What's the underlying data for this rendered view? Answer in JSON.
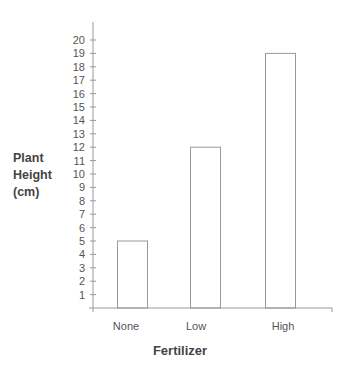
{
  "chart_data": {
    "type": "bar",
    "title": "",
    "categories": [
      "None",
      "Low",
      "High"
    ],
    "values": [
      5,
      12,
      19
    ],
    "xlabel": "Fertilizer",
    "ylabel": "Plant Height (cm)",
    "ylabel_lines": [
      "Plant",
      "Height",
      "(cm)"
    ],
    "ylim": [
      0,
      20
    ],
    "yticks": [
      1,
      2,
      3,
      4,
      5,
      6,
      7,
      8,
      9,
      10,
      11,
      12,
      13,
      14,
      15,
      16,
      17,
      18,
      19,
      20
    ],
    "grid": false,
    "legend": null,
    "bar_fill": "#ffffff",
    "bar_stroke": "#999999"
  }
}
